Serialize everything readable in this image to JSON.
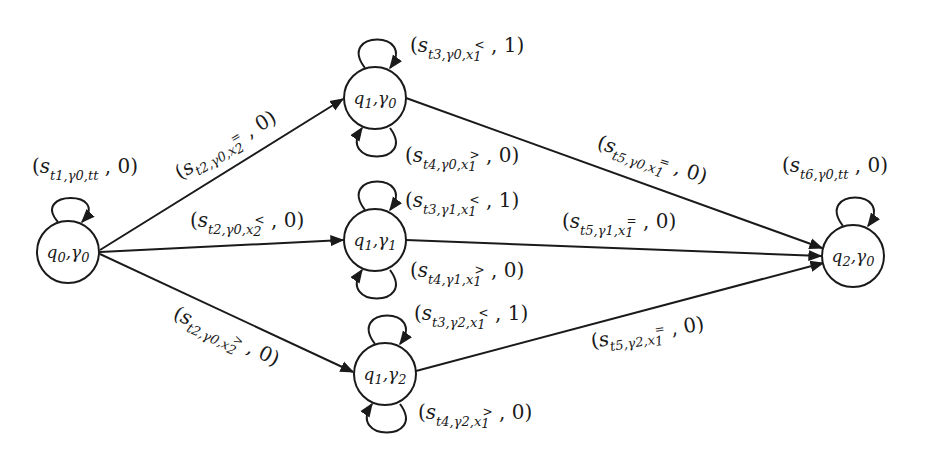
{
  "diagram": {
    "type": "state-transition-graph",
    "colors": {
      "stroke": "#1a1a1a",
      "background": "#ffffff"
    },
    "nodes": [
      {
        "id": "q0g0",
        "label": "q0,γ0",
        "state": "q",
        "state_sub": "0",
        "gamma_sub": "0"
      },
      {
        "id": "q1g0",
        "label": "q1,γ0",
        "state": "q",
        "state_sub": "1",
        "gamma_sub": "0"
      },
      {
        "id": "q1g1",
        "label": "q1,γ1",
        "state": "q",
        "state_sub": "1",
        "gamma_sub": "1"
      },
      {
        "id": "q1g2",
        "label": "q1,γ2",
        "state": "q",
        "state_sub": "1",
        "gamma_sub": "2"
      },
      {
        "id": "q2g0",
        "label": "q2,γ0",
        "state": "q",
        "state_sub": "2",
        "gamma_sub": "0"
      }
    ],
    "edges": [
      {
        "from": "q0g0",
        "to": "q0g0",
        "label": "(s_{t1,γ0,tt}, 0)",
        "t": "1",
        "g": "0",
        "cond": "tt",
        "w": "0"
      },
      {
        "from": "q0g0",
        "to": "q1g0",
        "label": "(s_{t2,γ0,x2=}, 0)",
        "t": "2",
        "g": "0",
        "cond": "x",
        "cond_sub": "2",
        "cond_sup": "=",
        "w": "0"
      },
      {
        "from": "q0g0",
        "to": "q1g1",
        "label": "(s_{t2,γ0,x2<}, 0)",
        "t": "2",
        "g": "0",
        "cond": "x",
        "cond_sub": "2",
        "cond_sup": "<",
        "w": "0"
      },
      {
        "from": "q0g0",
        "to": "q1g2",
        "label": "(s_{t2,γ0,x2>}, 0)",
        "t": "2",
        "g": "0",
        "cond": "x",
        "cond_sub": "2",
        "cond_sup": ">",
        "w": "0"
      },
      {
        "from": "q1g0",
        "to": "q1g0",
        "label": "(s_{t3,γ0,x1<}, 1)",
        "t": "3",
        "g": "0",
        "cond": "x",
        "cond_sub": "1",
        "cond_sup": "<",
        "w": "1"
      },
      {
        "from": "q1g0",
        "to": "q1g0",
        "label": "(s_{t4,γ0,x1>}, 0)",
        "t": "4",
        "g": "0",
        "cond": "x",
        "cond_sub": "1",
        "cond_sup": ">",
        "w": "0"
      },
      {
        "from": "q1g1",
        "to": "q1g1",
        "label": "(s_{t3,γ1,x1<}, 1)",
        "t": "3",
        "g": "1",
        "cond": "x",
        "cond_sub": "1",
        "cond_sup": "<",
        "w": "1"
      },
      {
        "from": "q1g1",
        "to": "q1g1",
        "label": "(s_{t4,γ1,x1>}, 0)",
        "t": "4",
        "g": "1",
        "cond": "x",
        "cond_sub": "1",
        "cond_sup": ">",
        "w": "0"
      },
      {
        "from": "q1g2",
        "to": "q1g2",
        "label": "(s_{t3,γ2,x1<}, 1)",
        "t": "3",
        "g": "2",
        "cond": "x",
        "cond_sub": "1",
        "cond_sup": "<",
        "w": "1"
      },
      {
        "from": "q1g2",
        "to": "q1g2",
        "label": "(s_{t4,γ2,x1>}, 0)",
        "t": "4",
        "g": "2",
        "cond": "x",
        "cond_sub": "1",
        "cond_sup": ">",
        "w": "0"
      },
      {
        "from": "q1g0",
        "to": "q2g0",
        "label": "(s_{t5,γ0,x1=}, 0)",
        "t": "5",
        "g": "0",
        "cond": "x",
        "cond_sub": "1",
        "cond_sup": "=",
        "w": "0"
      },
      {
        "from": "q1g1",
        "to": "q2g0",
        "label": "(s_{t5,γ1,x1=}, 0)",
        "t": "5",
        "g": "1",
        "cond": "x",
        "cond_sub": "1",
        "cond_sup": "=",
        "w": "0"
      },
      {
        "from": "q1g2",
        "to": "q2g0",
        "label": "(s_{t5,γ2,x1=}, 0)",
        "t": "5",
        "g": "2",
        "cond": "x",
        "cond_sub": "1",
        "cond_sup": "=",
        "w": "0"
      },
      {
        "from": "q2g0",
        "to": "q2g0",
        "label": "(s_{t6,γ0,tt}, 0)",
        "t": "6",
        "g": "0",
        "cond": "tt",
        "w": "0"
      }
    ]
  },
  "symbols": {
    "s": "s",
    "t": "t",
    "gamma": "γ",
    "x": "x",
    "q": "q",
    "open": "(",
    "close": ")",
    "comma": ",",
    "sep": ","
  }
}
